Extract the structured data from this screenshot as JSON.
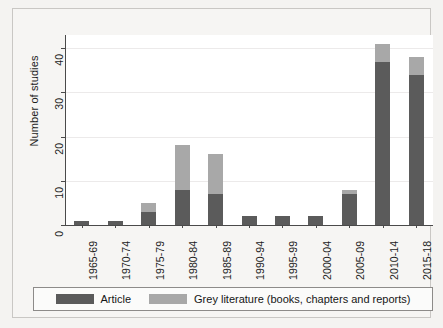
{
  "chart_data": {
    "type": "bar",
    "stacked": true,
    "title": "",
    "xlabel": "",
    "ylabel": "Number of studies",
    "ylim": [
      0,
      43
    ],
    "yticks": [
      0,
      10,
      20,
      30,
      40
    ],
    "ytick_labels": [
      "0",
      "10",
      "20",
      "30",
      "40"
    ],
    "grid": true,
    "grid_axis": "y",
    "legend_position": "bottom",
    "categories": [
      "1965-69",
      "1970-74",
      "1975-79",
      "1980-84",
      "1985-89",
      "1990-94",
      "1995-99",
      "2000-04",
      "2005-09",
      "2010-14",
      "2015-18"
    ],
    "series": [
      {
        "name": "Article",
        "color": "#5b5b5b",
        "values": [
          1,
          1,
          3,
          8,
          7,
          2,
          2,
          2,
          7,
          37,
          34
        ]
      },
      {
        "name": "Grey literature (books, chapters and reports)",
        "color": "#a8a8a8",
        "values": [
          0,
          0,
          2,
          10,
          9,
          0,
          0,
          0,
          1,
          4,
          4
        ]
      }
    ],
    "totals": [
      1,
      1,
      5,
      18,
      16,
      2,
      2,
      2,
      8,
      41,
      38
    ]
  },
  "legend": {
    "entries": [
      {
        "label": "Article",
        "color": "#5b5b5b"
      },
      {
        "label": "Grey literature (books, chapters and reports)",
        "color": "#a8a8a8"
      }
    ]
  },
  "axes": {
    "y_title": "Number of studies"
  }
}
